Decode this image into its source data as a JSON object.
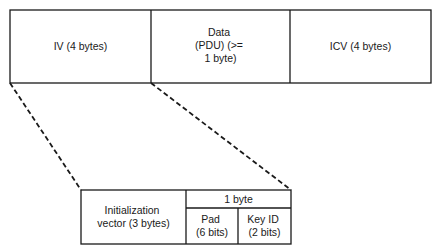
{
  "frame": {
    "fields": [
      {
        "lines": [
          "IV (4 bytes)"
        ]
      },
      {
        "lines": [
          "Data",
          "(PDU) (>=",
          "1 byte)"
        ]
      },
      {
        "lines": [
          "ICV (4 bytes)"
        ]
      }
    ]
  },
  "iv_detail": {
    "init_vector": {
      "lines": [
        "Initialization",
        "vector (3 bytes)"
      ]
    },
    "byte_header": "1 byte",
    "pad": {
      "lines": [
        "Pad",
        "(6 bits)"
      ]
    },
    "key_id": {
      "lines": [
        "Key ID",
        "(2 bits)"
      ]
    }
  },
  "colors": {
    "line": "#1a1a1a",
    "background": "#ffffff"
  }
}
